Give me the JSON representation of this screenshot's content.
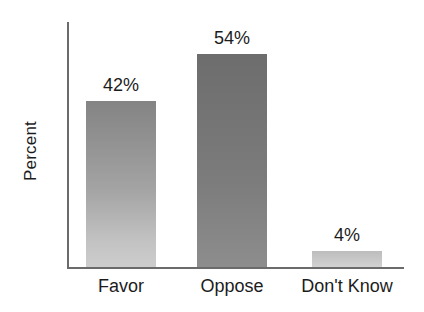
{
  "chart_data": {
    "type": "bar",
    "title": "",
    "xlabel": "",
    "ylabel": "Percent",
    "categories": [
      "Favor",
      "Oppose",
      "Don't Know"
    ],
    "values": [
      42,
      54,
      4
    ],
    "value_labels": [
      "42%",
      "54%",
      "4%"
    ],
    "ylim": [
      0,
      62
    ],
    "grid": false,
    "legend": false,
    "axis_tick_labels": [],
    "series": [
      {
        "name": "Percent",
        "values": [
          42,
          54,
          4
        ]
      }
    ],
    "bar_colors": [
      "#a5a5a5",
      "#7c7c7c",
      "#c9c9c9"
    ],
    "axis_color": "#6b6b6b",
    "text_color": "#1c1c1c",
    "background_color": "#ffffff"
  }
}
